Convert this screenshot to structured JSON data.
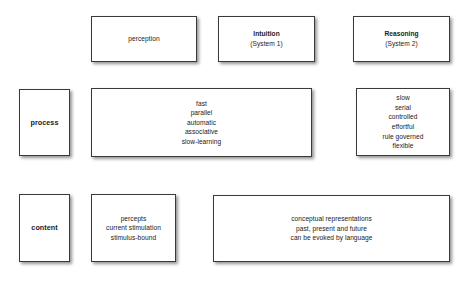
{
  "diagram": {
    "background_color": "#ffffff",
    "box_border_color": "#3a3a3a",
    "text_color": "#1a1a1a",
    "row_labels": {
      "process": "process",
      "content": "content"
    },
    "column_headers": {
      "perception": {
        "title": "perception",
        "subtitle": ""
      },
      "intuition": {
        "title": "Intuition",
        "subtitle": "(System 1)"
      },
      "reasoning": {
        "title": "Reasoning",
        "subtitle": "(System 2)"
      }
    },
    "process_row": {
      "perception_intuition": [
        "fast",
        "parallel",
        "automatic",
        "associative",
        "slow-learning"
      ],
      "reasoning": [
        "slow",
        "serial",
        "controlled",
        "effortful",
        "rule governed",
        "flexible"
      ]
    },
    "content_row": {
      "perception": [
        "percepts",
        "current stimulation",
        "stimulus-bound"
      ],
      "intuition_reasoning": [
        "conceptual representations",
        "past, present and future",
        "can be evoked by language"
      ]
    }
  }
}
